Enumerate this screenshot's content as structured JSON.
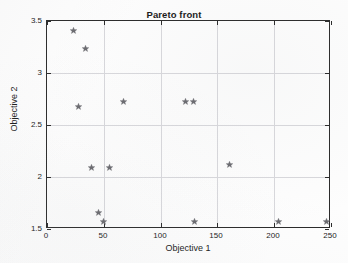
{
  "chart_data": {
    "type": "scatter",
    "title": "Pareto front",
    "xlabel": "Objective 1",
    "ylabel": "Objective 2",
    "xlim": [
      0,
      250
    ],
    "ylim": [
      1.5,
      3.5
    ],
    "xticks": [
      0,
      50,
      100,
      150,
      200,
      250
    ],
    "yticks": [
      1.5,
      2,
      2.5,
      3,
      3.5
    ],
    "xtick_labels": [
      "0",
      "50",
      "100",
      "150",
      "200",
      "250"
    ],
    "ytick_labels": [
      "1.5",
      "2",
      "2.5",
      "3",
      "3.5"
    ],
    "grid": true,
    "legend": null,
    "marker": "pentagram-star",
    "marker_color": "#6b6b70",
    "series": [
      {
        "name": "Pareto front solutions",
        "points": [
          {
            "x": 23,
            "y": 3.41
          },
          {
            "x": 34,
            "y": 3.24
          },
          {
            "x": 28,
            "y": 2.68
          },
          {
            "x": 67,
            "y": 2.73
          },
          {
            "x": 122,
            "y": 2.73
          },
          {
            "x": 129,
            "y": 2.73
          },
          {
            "x": 39,
            "y": 2.09
          },
          {
            "x": 55,
            "y": 2.09
          },
          {
            "x": 161,
            "y": 2.12
          },
          {
            "x": 45,
            "y": 1.66
          },
          {
            "x": 50,
            "y": 1.57
          },
          {
            "x": 130,
            "y": 1.57
          },
          {
            "x": 204,
            "y": 1.57
          },
          {
            "x": 246,
            "y": 1.57
          }
        ]
      }
    ]
  },
  "axes": {
    "title": "Pareto front",
    "x_title": "Objective 1",
    "y_title": "Objective 2"
  }
}
